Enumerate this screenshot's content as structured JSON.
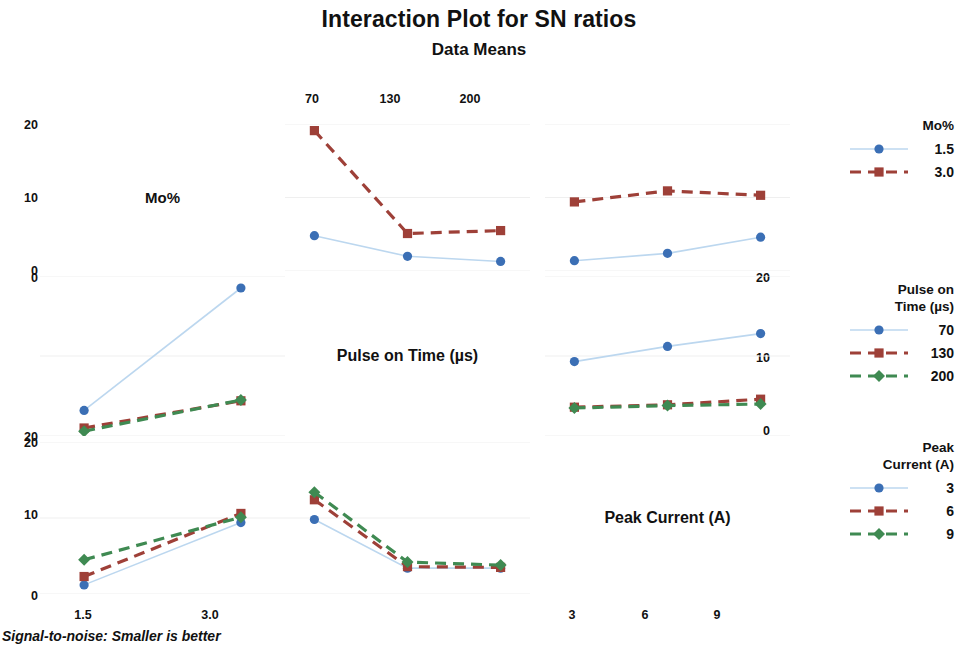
{
  "header": {
    "title": "Interaction Plot for SN ratios",
    "subtitle": "Data Means"
  },
  "footnote": "Signal-to-noise: Smaller is better",
  "factors": {
    "mo": "Mo%",
    "pulse": "Pulse on Time (µs)",
    "peak": "Peak Current (A)"
  },
  "axes": {
    "y_left_top": [
      "20",
      "10",
      "0"
    ],
    "y_left_mid": [
      "0",
      "10",
      "20"
    ],
    "y_left_bottom": [
      "20",
      "10",
      "0"
    ],
    "y_right_mid": [
      "20",
      "10",
      "0"
    ],
    "x_top": [
      "70",
      "130",
      "200"
    ],
    "x_bottom_left": [
      "1.5",
      "3.0"
    ],
    "x_bottom_right": [
      "3",
      "6",
      "9"
    ]
  },
  "legends": [
    {
      "name": "mo-legend",
      "title": "Mo%",
      "title_lines": [
        "Mo%"
      ],
      "entries": [
        {
          "label": "1.5",
          "color": "#3b6fb5",
          "marker": "circle",
          "dash": "solid",
          "line": "#bcd7ef"
        },
        {
          "label": "3.0",
          "color": "#9e4038",
          "marker": "square",
          "dash": "dashed",
          "line": "#9e4038"
        }
      ]
    },
    {
      "name": "pulse-legend",
      "title": "Pulse on Time (µs)",
      "title_lines": [
        "Pulse on",
        "Time (µs)"
      ],
      "entries": [
        {
          "label": "70",
          "color": "#3b6fb5",
          "marker": "circle",
          "dash": "solid",
          "line": "#bcd7ef"
        },
        {
          "label": "130",
          "color": "#9e4038",
          "marker": "square",
          "dash": "dashed",
          "line": "#9e4038"
        },
        {
          "label": "200",
          "color": "#3f8a52",
          "marker": "diamond",
          "dash": "dashed",
          "line": "#3f8a52"
        }
      ]
    },
    {
      "name": "peak-legend",
      "title": "Peak Current (A)",
      "title_lines": [
        "Peak",
        "Current (A)"
      ],
      "entries": [
        {
          "label": "3",
          "color": "#3b6fb5",
          "marker": "circle",
          "dash": "solid",
          "line": "#bcd7ef"
        },
        {
          "label": "6",
          "color": "#9e4038",
          "marker": "square",
          "dash": "dashed",
          "line": "#9e4038"
        },
        {
          "label": "9",
          "color": "#3f8a52",
          "marker": "diamond",
          "dash": "dashed",
          "line": "#3f8a52"
        }
      ]
    }
  ],
  "colors": {
    "blue": "#3b6fb5",
    "blue_line": "#bcd7ef",
    "red": "#9e4038",
    "green": "#3f8a52",
    "grid": "#efefef",
    "text": "#111111"
  },
  "chart_data": {
    "type": "line",
    "title": "Interaction Plot for SN ratios",
    "subtitle": "Data Means",
    "ylabel": "",
    "xlabel": "",
    "ylim": [
      0,
      20
    ],
    "y_ticks": [
      0,
      10,
      20
    ],
    "grid": true,
    "note": "3x3 interaction matrix; diagonal cells are factor name labels. Upper-left axis is inverted in the middle-left panel (0 at top, 20 at bottom).",
    "panels": [
      {
        "row": 0,
        "col": 0,
        "kind": "label",
        "label": "Mo%"
      },
      {
        "row": 0,
        "col": 1,
        "kind": "plot",
        "x_factor": "Pulse on Time (µs)",
        "trace_factor": "Mo%",
        "categories": [
          "70",
          "130",
          "200"
        ],
        "ylim": [
          0,
          20
        ],
        "series": [
          {
            "name": "1.5",
            "color": "#3b6fb5",
            "marker": "circle",
            "dash": "solid",
            "values": [
              4.8,
              2.0,
              1.3
            ]
          },
          {
            "name": "3.0",
            "color": "#9e4038",
            "marker": "square",
            "dash": "dashed",
            "values": [
              19.1,
              5.1,
              5.5
            ]
          }
        ]
      },
      {
        "row": 0,
        "col": 2,
        "kind": "plot",
        "x_factor": "Peak Current (A)",
        "trace_factor": "Mo%",
        "categories": [
          "3",
          "6",
          "9"
        ],
        "ylim": [
          0,
          20
        ],
        "series": [
          {
            "name": "1.5",
            "color": "#3b6fb5",
            "marker": "circle",
            "dash": "solid",
            "values": [
              1.4,
              2.4,
              4.6
            ]
          },
          {
            "name": "3.0",
            "color": "#9e4038",
            "marker": "square",
            "dash": "dashed",
            "values": [
              9.4,
              10.9,
              10.3
            ]
          }
        ]
      },
      {
        "row": 1,
        "col": 0,
        "kind": "plot",
        "x_factor": "Mo%",
        "trace_factor": "Pulse on Time (µs)",
        "categories": [
          "1.5",
          "3.0"
        ],
        "ylim": [
          0,
          20
        ],
        "y_inverted": true,
        "series": [
          {
            "name": "70",
            "color": "#3b6fb5",
            "marker": "circle",
            "dash": "solid",
            "values": [
              16.8,
              1.5
            ]
          },
          {
            "name": "130",
            "color": "#9e4038",
            "marker": "square",
            "dash": "dashed",
            "values": [
              19.0,
              15.6
            ]
          },
          {
            "name": "200",
            "color": "#3f8a52",
            "marker": "diamond",
            "dash": "dashed",
            "values": [
              19.4,
              15.5
            ]
          }
        ]
      },
      {
        "row": 1,
        "col": 1,
        "kind": "label",
        "label": "Pulse on Time (µs)"
      },
      {
        "row": 1,
        "col": 2,
        "kind": "plot",
        "x_factor": "Peak Current (A)",
        "trace_factor": "Pulse on Time (µs)",
        "categories": [
          "3",
          "6",
          "9"
        ],
        "ylim": [
          0,
          20
        ],
        "series": [
          {
            "name": "70",
            "color": "#3b6fb5",
            "marker": "circle",
            "dash": "solid",
            "values": [
              9.3,
              11.2,
              12.8
            ]
          },
          {
            "name": "130",
            "color": "#9e4038",
            "marker": "square",
            "dash": "dashed",
            "values": [
              3.6,
              3.9,
              4.6
            ]
          },
          {
            "name": "200",
            "color": "#3f8a52",
            "marker": "diamond",
            "dash": "dashed",
            "values": [
              3.5,
              3.8,
              4.0
            ]
          }
        ]
      },
      {
        "row": 2,
        "col": 0,
        "kind": "plot",
        "x_factor": "Mo%",
        "trace_factor": "Peak Current (A)",
        "categories": [
          "1.5",
          "3.0"
        ],
        "ylim": [
          0,
          20
        ],
        "series": [
          {
            "name": "3",
            "color": "#3b6fb5",
            "marker": "circle",
            "dash": "solid",
            "values": [
              1.2,
              9.4
            ]
          },
          {
            "name": "6",
            "color": "#9e4038",
            "marker": "square",
            "dash": "dashed",
            "values": [
              2.3,
              10.6
            ]
          },
          {
            "name": "9",
            "color": "#3f8a52",
            "marker": "diamond",
            "dash": "dashed",
            "values": [
              4.5,
              10.1
            ]
          }
        ]
      },
      {
        "row": 2,
        "col": 1,
        "kind": "plot",
        "x_factor": "Pulse on Time (µs)",
        "trace_factor": "Peak Current (A)",
        "categories": [
          "70",
          "130",
          "200"
        ],
        "ylim": [
          0,
          20
        ],
        "series": [
          {
            "name": "3",
            "color": "#3b6fb5",
            "marker": "circle",
            "dash": "solid",
            "values": [
              9.8,
              3.4,
              3.4
            ]
          },
          {
            "name": "6",
            "color": "#9e4038",
            "marker": "square",
            "dash": "dashed",
            "values": [
              12.4,
              3.6,
              3.5
            ]
          },
          {
            "name": "9",
            "color": "#3f8a52",
            "marker": "diamond",
            "dash": "dashed",
            "values": [
              13.4,
              4.2,
              3.8
            ]
          }
        ]
      },
      {
        "row": 2,
        "col": 2,
        "kind": "label",
        "label": "Peak Current (A)"
      }
    ]
  }
}
